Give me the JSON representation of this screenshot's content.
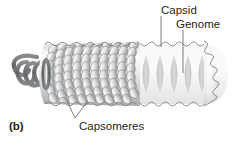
{
  "figure": {
    "panel_label": "(b)",
    "labels": {
      "capsid": "Capsid",
      "genome": "Genome",
      "capsomeres": "Capsomeres"
    },
    "parts": [
      {
        "name": "capsid",
        "label": "Capsid",
        "description": "outer protein coat built of capsomeres, drawn as a rod with scalloped wavy outline",
        "icon": "capsid-rod-shape"
      },
      {
        "name": "genome",
        "label": "Genome",
        "description": "helical nucleic acid strand coiled inside the capsid, visible as ghosted coils",
        "icon": "helix-coil-shape"
      },
      {
        "name": "capsomeres",
        "label": "Capsomeres",
        "description": "individual teardrop-shaped protein subunits tiled in helical rows on the capsid surface",
        "icon": "capsomere-subunit-shape"
      }
    ],
    "colors": {
      "text": "#231f20",
      "leader_line": "#58595b",
      "capsid_outline": "#808285",
      "capsomere_fill_light": "#f2f2f2",
      "capsomere_fill_mid": "#c9cacb",
      "capsomere_fill_dark": "#8c8e90",
      "genome_helix": "#6d6e70",
      "ghost_body": "#ededee",
      "background": "#ffffff"
    },
    "counts": {
      "ghost_helix_loops": 5,
      "exterior_helix_loops": 3,
      "capsomere_rows": 9,
      "capsomere_leader_prongs": 2
    }
  }
}
